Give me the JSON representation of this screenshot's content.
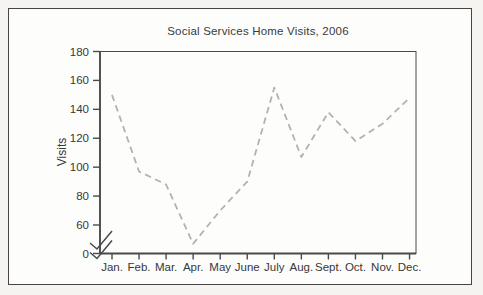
{
  "chart_data": {
    "type": "line",
    "title": "Social Services Home Visits, 2006",
    "ylabel": "Visits",
    "xlabel": "",
    "categories": [
      "Jan.",
      "Feb.",
      "Mar.",
      "Apr.",
      "May",
      "June",
      "July",
      "Aug.",
      "Sept.",
      "Oct.",
      "Nov.",
      "Dec."
    ],
    "values": [
      150,
      97,
      88,
      47,
      70,
      90,
      155,
      107,
      138,
      118,
      130,
      148
    ],
    "y_ticks": [
      0,
      60,
      80,
      100,
      120,
      140,
      160,
      180
    ],
    "ylim": [
      0,
      180
    ],
    "axis_break": true,
    "axis_break_between": [
      0,
      60
    ],
    "grid": false,
    "legend": null,
    "line_style": "dashed",
    "line_color": "#b3b3ad",
    "axis_color": "#4a4a4a",
    "text_color": "#383838"
  }
}
